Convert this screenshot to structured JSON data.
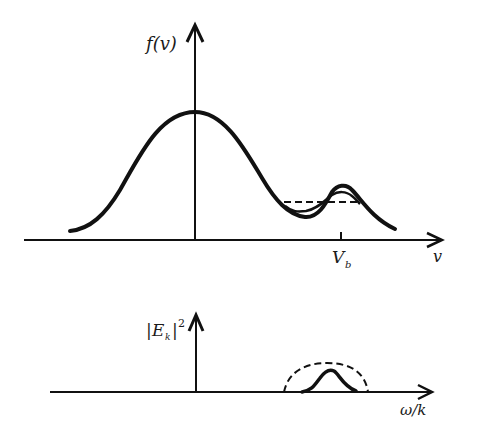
{
  "diagram": {
    "top_panel": {
      "y_label": "f(v)",
      "x_label": "v",
      "tick_label_main": "V",
      "tick_label_sub": "b",
      "curves": [
        "initial distribution with beam bump",
        "intermediate (flattening) distribution",
        "plateau (dashed)"
      ]
    },
    "bottom_panel": {
      "y_label_main": "|E",
      "y_label_sub": "k",
      "y_label_end": "|",
      "y_label_sup": "2",
      "x_label": "ω/k",
      "curves": [
        "initial wave spectrum (solid)",
        "saturated wave spectrum (dashed)"
      ]
    },
    "colors": {
      "ink": "#111111",
      "background": "#ffffff"
    }
  }
}
